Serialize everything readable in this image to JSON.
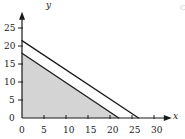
{
  "chart_data": {
    "type": "line",
    "title": "",
    "subtitle": "",
    "xlabel": "x",
    "ylabel": "y",
    "xlim": [
      0,
      32
    ],
    "ylim": [
      0,
      27
    ],
    "grid": false,
    "legend": null,
    "xticks": [
      0,
      5,
      10,
      15,
      20,
      25,
      30
    ],
    "xtick_labels": [
      "0",
      "5",
      "10",
      "15",
      "20",
      "25",
      "30"
    ],
    "yticks": [
      0,
      5,
      10,
      15,
      20,
      25
    ],
    "ytick_labels": [
      "0",
      "5",
      "10",
      "15",
      "20",
      "25"
    ],
    "series": [
      {
        "name": "line-1",
        "type": "line",
        "color": "#1a1a1a",
        "x": [
          0,
          26.5
        ],
        "y": [
          21.5,
          0
        ],
        "y_intercept": 21.5,
        "x_intercept": 26.5
      },
      {
        "name": "line-2",
        "type": "line",
        "color": "#1a1a1a",
        "x": [
          0,
          22
        ],
        "y": [
          18,
          0
        ],
        "y_intercept": 18,
        "x_intercept": 22
      }
    ],
    "intersection": {
      "x": 11.6,
      "y": 8.5
    },
    "shaded_region": {
      "name": "feasible-region",
      "fill": "#d4d4d4",
      "description": "region bounded below both lines in the first quadrant",
      "vertices": [
        [
          0,
          0
        ],
        [
          0,
          18
        ],
        [
          11.6,
          8.5
        ],
        [
          22,
          0
        ]
      ]
    },
    "annotations": [
      {
        "name": "corner-mark",
        "text": "C",
        "x": 180,
        "y": 4
      }
    ],
    "colors": {
      "axis": "#1a1a1a",
      "line": "#1a1a1a",
      "fill": "#d4d4d4",
      "background": "#ffffff"
    }
  }
}
